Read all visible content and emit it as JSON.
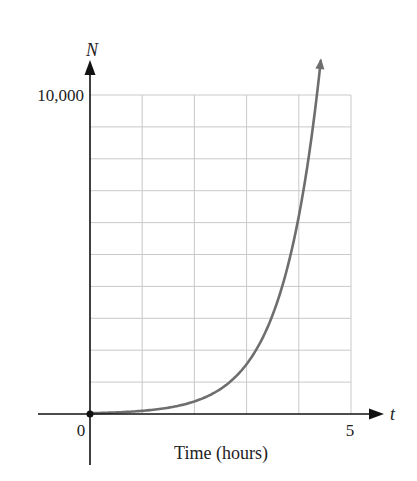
{
  "chart_data": {
    "type": "line",
    "title": "",
    "xlabel": "Time (hours)",
    "ylabel": "",
    "x_axis_var": "t",
    "y_axis_var": "N",
    "xlim": [
      0,
      5
    ],
    "ylim": [
      0,
      10000
    ],
    "x_ticks": [
      {
        "value": 0,
        "label": "0"
      },
      {
        "value": 5,
        "label": "5"
      }
    ],
    "y_ticks": [
      {
        "value": 10000,
        "label": "10,000"
      }
    ],
    "grid": {
      "on": true,
      "x_step": 1,
      "y_step": 1000
    },
    "legend": null,
    "series": [
      {
        "name": "N(t)",
        "color": "#6e6e6e",
        "x": [
          0,
          1,
          2,
          3,
          4,
          4.27
        ],
        "values": [
          25,
          100,
          400,
          1500,
          6200,
          10000
        ],
        "continues_beyond_plot": true,
        "start_point_marked": true
      }
    ]
  },
  "labels": {
    "y_var": "N",
    "x_var": "t",
    "y_max_tick": "10,000",
    "x_origin_tick": "0",
    "x_max_tick": "5",
    "x_title": "Time (hours)"
  },
  "colors": {
    "axis": "#111111",
    "grid": "#c9c9c9",
    "curve": "#6e6e6e"
  }
}
